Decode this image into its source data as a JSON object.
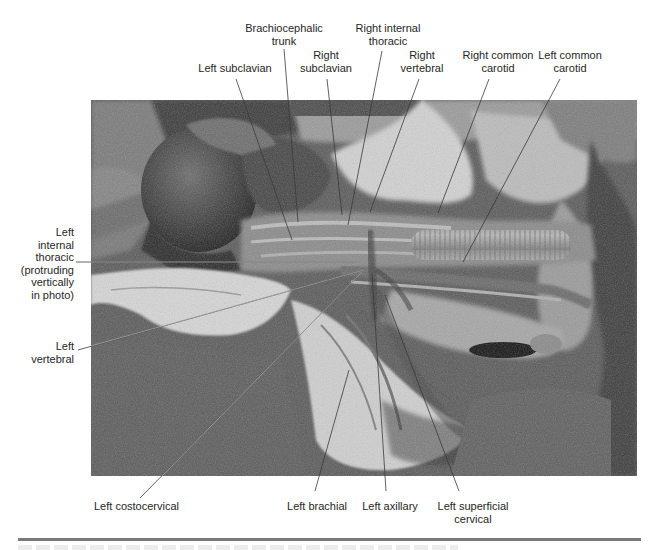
{
  "figure": {
    "type": "anatomical-photograph",
    "colors": {
      "background": "#ffffff",
      "label_text": "#262626",
      "leader_line": "#3a3a3a",
      "leader_line_on_photo": "#e8e8e8",
      "rule": "#7a7a7a"
    }
  },
  "labels": {
    "brachiocephalic_trunk": "Brachiocephalic\ntrunk",
    "right_internal_thoracic": "Right internal\nthoracic",
    "left_subclavian": "Left subclavian",
    "right_subclavian": "Right\nsubclavian",
    "right_vertebral": "Right\nvertebral",
    "right_common_carotid": "Right common\ncarotid",
    "left_common_carotid": "Left common\ncarotid",
    "left_internal_thoracic": "Left\ninternal\nthoracic\n(protruding\nvertically\nin photo)",
    "left_vertebral": "Left\nvertebral",
    "left_costocervical": "Left costocervical",
    "left_brachial": "Left brachial",
    "left_axillary": "Left axillary",
    "left_superficial_cervical": "Left superficial\ncervical"
  },
  "leaders": [
    {
      "id": "brachiocephalic_trunk",
      "x1": 284,
      "y1": 49,
      "x2": 298,
      "y2": 222
    },
    {
      "id": "right_internal_thoracic",
      "x1": 382,
      "y1": 51,
      "x2": 348,
      "y2": 225
    },
    {
      "id": "left_subclavian",
      "x1": 236,
      "y1": 79,
      "x2": 292,
      "y2": 240
    },
    {
      "id": "right_subclavian",
      "x1": 327,
      "y1": 79,
      "x2": 342,
      "y2": 215
    },
    {
      "id": "right_vertebral",
      "x1": 419,
      "y1": 79,
      "x2": 370,
      "y2": 212
    },
    {
      "id": "right_common_carotid",
      "x1": 489,
      "y1": 79,
      "x2": 438,
      "y2": 213
    },
    {
      "id": "left_common_carotid",
      "x1": 560,
      "y1": 79,
      "x2": 463,
      "y2": 262
    },
    {
      "id": "left_internal_thoracic",
      "x1": 76,
      "y1": 262,
      "x2": 360,
      "y2": 262
    },
    {
      "id": "left_vertebral",
      "x1": 78,
      "y1": 350,
      "x2": 364,
      "y2": 270
    },
    {
      "id": "left_costocervical",
      "x1": 140,
      "y1": 498,
      "x2": 362,
      "y2": 272
    },
    {
      "id": "left_brachial",
      "x1": 315,
      "y1": 491,
      "x2": 349,
      "y2": 370
    },
    {
      "id": "left_axillary",
      "x1": 386,
      "y1": 491,
      "x2": 372,
      "y2": 274
    },
    {
      "id": "left_superficial_cervical",
      "x1": 459,
      "y1": 491,
      "x2": 385,
      "y2": 295
    }
  ],
  "caption": {
    "visible_text": ""
  }
}
